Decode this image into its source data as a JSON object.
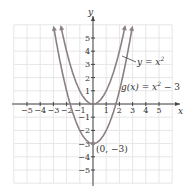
{
  "chart_data": {
    "type": "line",
    "title": "",
    "xlabel": "x",
    "ylabel": "y",
    "xlim": [
      -6,
      6
    ],
    "ylim": [
      -6,
      6
    ],
    "grid": true,
    "x_ticks": [
      -5,
      -4,
      -3,
      -2,
      -1,
      1,
      2,
      3,
      4,
      5
    ],
    "y_ticks": [
      -5,
      -4,
      -3,
      -2,
      -1,
      1,
      2,
      3,
      4,
      5
    ],
    "series": [
      {
        "name": "y = x^2",
        "formula": "x^2",
        "x": [
          -2.4,
          -2,
          -1,
          0,
          1,
          2,
          2.4
        ],
        "values": [
          5.76,
          4,
          1,
          0,
          1,
          4,
          5.76
        ]
      },
      {
        "name": "g(x) = x^2 - 3",
        "formula": "x^2 - 3",
        "x": [
          -2.95,
          -2,
          -1,
          0,
          1,
          2,
          2.95
        ],
        "values": [
          5.7,
          1,
          -2,
          -3,
          -2,
          1,
          5.7
        ]
      }
    ],
    "annotations": [
      {
        "text": "y = x²",
        "points_to": "y = x^2"
      },
      {
        "text": "g(x) = x² − 3",
        "points_to": "g(x) = x^2 - 3"
      },
      {
        "text": "(0, −3)",
        "point": [
          0,
          -3
        ]
      }
    ]
  },
  "labels": {
    "x_axis": "x",
    "y_axis": "y",
    "curve1": "y = x",
    "curve1_exp": "2",
    "curve2_pre": "g(x) = x",
    "curve2_exp": "2",
    "curve2_post": " − 3",
    "vertex": "(0, −3)"
  },
  "colors": {
    "curve": "#8a7f86",
    "axis": "#444444",
    "grid": "#e6e6e6"
  }
}
